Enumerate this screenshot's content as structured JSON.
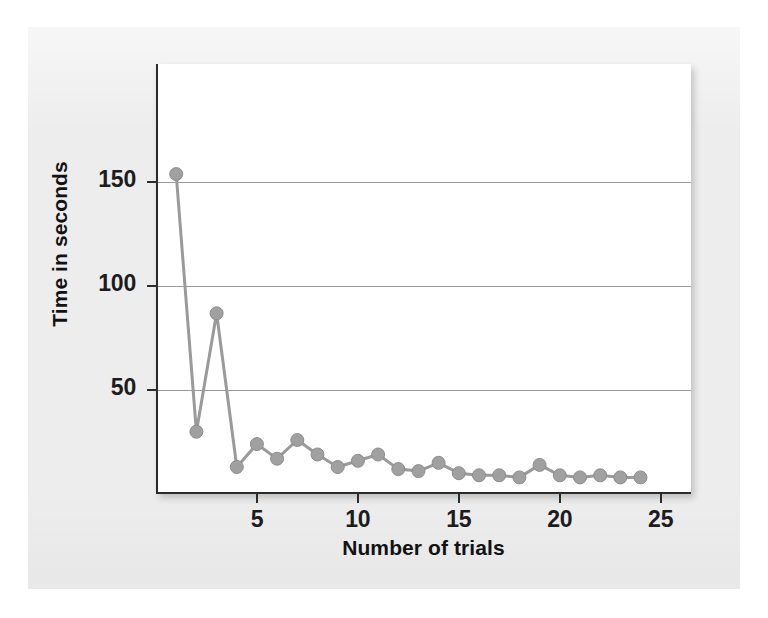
{
  "chart_data": {
    "type": "line",
    "title": "",
    "xlabel": "Number of trials",
    "ylabel": "Time in seconds",
    "x": [
      1,
      2,
      3,
      4,
      5,
      6,
      7,
      8,
      9,
      10,
      11,
      12,
      13,
      14,
      15,
      16,
      17,
      18,
      19,
      20,
      21,
      22,
      23,
      24
    ],
    "values": [
      154,
      30,
      87,
      13,
      24,
      17,
      26,
      19,
      13,
      16,
      19,
      12,
      11,
      15,
      10,
      9,
      9,
      8,
      14,
      9,
      8,
      9,
      8,
      8
    ],
    "series": [
      {
        "name": "Time in seconds",
        "values": [
          154,
          30,
          87,
          13,
          24,
          17,
          26,
          19,
          13,
          16,
          19,
          12,
          11,
          15,
          10,
          9,
          9,
          8,
          14,
          9,
          8,
          9,
          8,
          8
        ]
      }
    ],
    "xlim": [
      0,
      26.5
    ],
    "ylim": [
      0,
      207
    ],
    "xticks": [
      5,
      10,
      15,
      20,
      25
    ],
    "xtick_labels": [
      "5",
      "10",
      "15",
      "20",
      "25"
    ],
    "yticks": [
      50,
      100,
      150
    ],
    "ytick_labels": [
      "50",
      "100",
      "150"
    ],
    "grid": "horizontal",
    "legend": "none",
    "marker": "circle",
    "colors": {
      "series_line": "#9a9a9a",
      "marker_fill": "#a0a0a0",
      "marker_edge": "#8d8d8d",
      "gridline": "#9a9a9a",
      "axis": "#2b2b2b",
      "plot_background": "#ffffff",
      "page_background": "#ededee",
      "text": "#121212"
    }
  }
}
